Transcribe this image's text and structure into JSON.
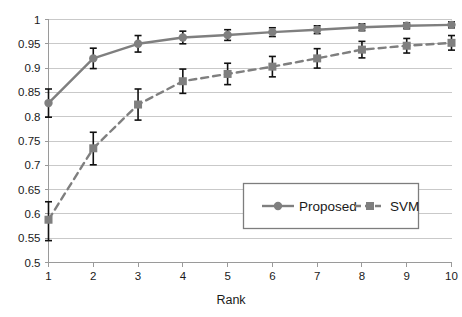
{
  "chart_data": {
    "type": "line",
    "title": "",
    "xlabel": "Rank",
    "ylabel": "",
    "x": [
      1,
      2,
      3,
      4,
      5,
      6,
      7,
      8,
      9,
      10
    ],
    "categories": [
      "1",
      "2",
      "3",
      "4",
      "5",
      "6",
      "7",
      "8",
      "9",
      "10"
    ],
    "xlim": [
      1,
      10
    ],
    "ylim": [
      0.5,
      1
    ],
    "ytick_labels": [
      "1",
      "0.95",
      "0.9",
      "0.85",
      "0.8",
      "0.75",
      "0.7",
      "0.65",
      "0.6",
      "0.55",
      "0.5"
    ],
    "ytick_values": [
      1,
      0.95,
      0.9,
      0.85,
      0.8,
      0.75,
      0.7,
      0.65,
      0.6,
      0.55,
      0.5
    ],
    "xtick_labels": [
      "1",
      "2",
      "3",
      "4",
      "5",
      "6",
      "7",
      "8",
      "9",
      "10"
    ],
    "grid": "horizontal",
    "legend_position": "lower-right-inside",
    "series": [
      {
        "name": "Proposed",
        "line_style": "solid",
        "marker": "circle",
        "color": "#7f7f7f",
        "values": [
          0.828,
          0.92,
          0.95,
          0.963,
          0.968,
          0.974,
          0.979,
          0.984,
          0.987,
          0.989
        ],
        "err_low": [
          0.799,
          0.899,
          0.933,
          0.95,
          0.957,
          0.965,
          0.971,
          0.977,
          0.981,
          0.983
        ],
        "err_high": [
          0.857,
          0.941,
          0.967,
          0.976,
          0.979,
          0.983,
          0.987,
          0.991,
          0.993,
          0.995
        ]
      },
      {
        "name": "SVM",
        "line_style": "dashed",
        "marker": "square",
        "color": "#7f7f7f",
        "values": [
          0.588,
          0.735,
          0.825,
          0.873,
          0.888,
          0.903,
          0.92,
          0.938,
          0.946,
          0.952
        ],
        "err_low": [
          0.545,
          0.701,
          0.793,
          0.848,
          0.866,
          0.882,
          0.9,
          0.921,
          0.931,
          0.937
        ],
        "err_high": [
          0.625,
          0.768,
          0.857,
          0.898,
          0.91,
          0.924,
          0.94,
          0.955,
          0.961,
          0.967
        ]
      }
    ]
  },
  "legend": {
    "entries": [
      {
        "label": "Proposed"
      },
      {
        "label": "SVM"
      }
    ]
  },
  "axes": {
    "x_title": "Rank"
  },
  "colors": {
    "series_gray": "#7f7f7f",
    "errorbar_black": "#111111",
    "gridline": "#c9c9c9",
    "axis": "#9a9a9a",
    "background": "#ffffff"
  }
}
